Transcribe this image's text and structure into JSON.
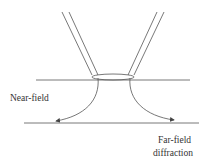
{
  "diagram": {
    "labels": {
      "near_field": "Near-field",
      "far_field": "Far-field",
      "diffraction": "diffraction"
    },
    "elements": [
      "probe-tip",
      "aperture-ellipse",
      "sample-surface-line",
      "far-field-plane-line",
      "diffraction-arrow-left",
      "diffraction-arrow-right"
    ],
    "colors": {
      "stroke": "#555555",
      "text": "#333333",
      "background": "#ffffff"
    }
  }
}
